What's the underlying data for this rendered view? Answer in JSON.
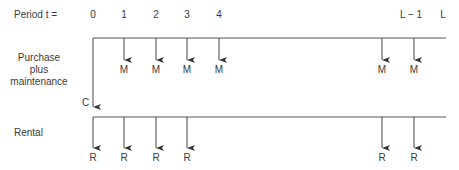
{
  "header": {
    "period_label": "Period t =",
    "periods": [
      {
        "label": "0",
        "x": 93
      },
      {
        "label": "1",
        "x": 124
      },
      {
        "label": "2",
        "x": 156
      },
      {
        "label": "3",
        "x": 187
      },
      {
        "label": "4",
        "x": 219
      },
      {
        "label": "L − 1",
        "x": 410
      },
      {
        "label": "L",
        "x": 443
      }
    ]
  },
  "purchase": {
    "label_line1": "Purchase",
    "label_line2": "plus",
    "label_line3": "maintenance",
    "initial_cost_label": "C",
    "flow_label": "M",
    "flow_positions": [
      124,
      156,
      187,
      219,
      382,
      414
    ]
  },
  "rental": {
    "label": "Rental",
    "flow_label": "R",
    "flow_positions": [
      93,
      124,
      156,
      187,
      382,
      414
    ]
  },
  "colors": {
    "line": "#444444",
    "text": "#3a3a3a"
  }
}
